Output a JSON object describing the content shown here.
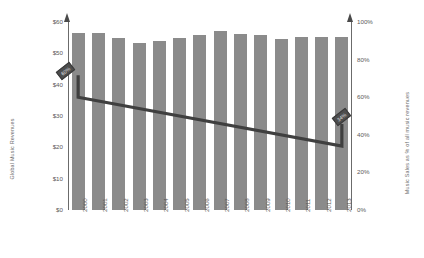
{
  "chart_data": {
    "type": "bar",
    "title": "",
    "xlabel": "",
    "ylabel": "Global Music Revenues",
    "y2label": "Music Sales as % of all music revenues",
    "categories": [
      "2000",
      "2001",
      "2002",
      "2003",
      "2004",
      "2005",
      "2006",
      "2007",
      "2008",
      "2009",
      "2010",
      "2011",
      "2012",
      "2013"
    ],
    "ylim": [
      0,
      60
    ],
    "y2lim": [
      0,
      100
    ],
    "grid": false,
    "legend": null,
    "left_ticks": [
      "$0",
      "$10",
      "$20",
      "$30",
      "$40",
      "$50",
      "$60"
    ],
    "left_tick_values": [
      0,
      10,
      20,
      30,
      40,
      50,
      60
    ],
    "right_ticks": [
      "0%",
      "20%",
      "40%",
      "60%",
      "80%",
      "100%"
    ],
    "right_tick_values": [
      0,
      20,
      40,
      60,
      80,
      100
    ],
    "series": [
      {
        "name": "Global Music Revenues",
        "type": "bar",
        "axis": "left",
        "color": "#8b8b8b",
        "values": [
          56.5,
          56.5,
          55.0,
          53.2,
          54.0,
          55.0,
          56.0,
          57.0,
          56.2,
          56.0,
          54.5,
          55.3,
          55.3,
          55.3
        ]
      },
      {
        "name": "Music Sales as % of all music revenues",
        "type": "line",
        "axis": "right",
        "color": "#3f3f3f",
        "x": [
          "2000",
          "2013"
        ],
        "values": [
          60,
          34
        ]
      }
    ],
    "annotations": [
      {
        "name": "start-callout",
        "text": "60%",
        "at_category": "2000",
        "value": 60
      },
      {
        "name": "end-callout",
        "text": "34%",
        "at_category": "2013",
        "value": 34
      }
    ]
  }
}
